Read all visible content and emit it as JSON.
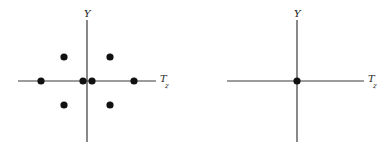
{
  "diagrams": [
    {
      "name": "left-weight-diagram",
      "y_label": "Y",
      "x_label": "T",
      "x_label_sub": "z",
      "origin": [
        87,
        81
      ],
      "x_axis": [
        18,
        156
      ],
      "y_axis": [
        20,
        142
      ],
      "points": [
        [
          64,
          57
        ],
        [
          110,
          57
        ],
        [
          41,
          81
        ],
        [
          83,
          81
        ],
        [
          92,
          81
        ],
        [
          134,
          81
        ],
        [
          64,
          105
        ],
        [
          110,
          105
        ]
      ]
    },
    {
      "name": "right-weight-diagram",
      "y_label": "Y",
      "x_label": "T",
      "x_label_sub": "z",
      "origin": [
        297,
        81
      ],
      "x_axis": [
        227,
        364
      ],
      "y_axis": [
        20,
        142
      ],
      "points": [
        [
          297,
          81
        ]
      ]
    }
  ],
  "chart_data": [
    {
      "type": "scatter",
      "title": "",
      "xlabel": "T_z",
      "ylabel": "Y",
      "points": [
        {
          "x": -1,
          "y": 1
        },
        {
          "x": 1,
          "y": 1
        },
        {
          "x": -2,
          "y": 0
        },
        {
          "x": -0.2,
          "y": 0
        },
        {
          "x": 0.2,
          "y": 0
        },
        {
          "x": 2,
          "y": 0
        },
        {
          "x": -1,
          "y": -1
        },
        {
          "x": 1,
          "y": -1
        }
      ],
      "grid": false
    },
    {
      "type": "scatter",
      "title": "",
      "xlabel": "T_z",
      "ylabel": "Y",
      "points": [
        {
          "x": 0,
          "y": 0
        }
      ],
      "grid": false
    }
  ]
}
